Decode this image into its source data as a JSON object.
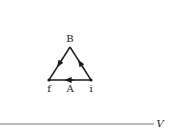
{
  "diagram": {
    "type": "thermodynamic-path-diagram",
    "vertices": {
      "B": {
        "label": "B",
        "x": 70,
        "y": 47
      },
      "f": {
        "label": "f",
        "x": 49,
        "y": 80
      },
      "i": {
        "label": "i",
        "x": 91,
        "y": 80
      }
    },
    "edge_labels": {
      "A": {
        "label": "A"
      }
    },
    "paths": [
      {
        "from": "i",
        "to": "f",
        "via": "A",
        "direction": "left"
      },
      {
        "from": "i",
        "to": "B",
        "direction": "up-left"
      },
      {
        "from": "B",
        "to": "f",
        "direction": "down-left"
      }
    ],
    "axis": {
      "x_label": "V"
    },
    "colors": {
      "stroke": "#1a1a1a",
      "axis": "#555555",
      "background": "#ffffff"
    }
  }
}
